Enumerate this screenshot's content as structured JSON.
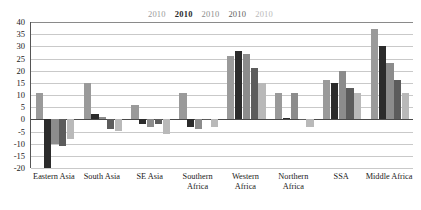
{
  "legend": {
    "items": [
      {
        "label": "2010",
        "color": "#9a9a9a"
      },
      {
        "label": "2010",
        "color": "#2b2b2b"
      },
      {
        "label": "2010",
        "color": "#8c8c8c"
      },
      {
        "label": "2010",
        "color": "#5c5c5c"
      },
      {
        "label": "2010",
        "color": "#b9b9b9"
      }
    ]
  },
  "axis": {
    "y_ticks": [
      "40",
      "35",
      "30",
      "25",
      "20",
      "15",
      "10",
      "5",
      "0",
      "-5",
      "-10",
      "-15",
      "-20"
    ]
  },
  "chart_data": {
    "type": "bar",
    "title": "",
    "subtitle": "",
    "xlabel": "",
    "ylabel": "",
    "ylim": [
      -20,
      40
    ],
    "ytick_step": 5,
    "grid": true,
    "legend_position": "top",
    "categories": [
      "Eastern Asia",
      "South Asia",
      "SE Asia",
      "Southern\nAfrica",
      "Western\nAfrica",
      "Northern\nAfrica",
      "SSA",
      "Middle Africa"
    ],
    "series": [
      {
        "name": "2010",
        "color": "#9a9a9a",
        "values": [
          11,
          15,
          6,
          11,
          26,
          11,
          16,
          37
        ]
      },
      {
        "name": "2010",
        "color": "#2b2b2b",
        "values": [
          -20,
          2,
          -2,
          -3,
          28,
          0.5,
          15,
          30
        ]
      },
      {
        "name": "2010",
        "color": "#8c8c8c",
        "values": [
          -10,
          1,
          -3,
          -4,
          27,
          11,
          20,
          23
        ]
      },
      {
        "name": "2010",
        "color": "#5c5c5c",
        "values": [
          -11,
          -4,
          -2,
          0,
          21,
          0,
          13,
          16
        ]
      },
      {
        "name": "2010",
        "color": "#b9b9b9",
        "values": [
          -8,
          -5,
          -6,
          -3,
          15,
          -3,
          11,
          11
        ]
      }
    ]
  }
}
